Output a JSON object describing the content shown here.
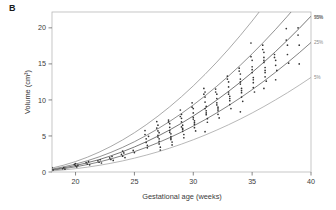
{
  "panel": {
    "label": "B"
  },
  "chart_data": {
    "type": "line",
    "title": "",
    "subtitle": "",
    "xlabel": "Gestational age (weeks)",
    "ylabel": "Volume (cm³)",
    "xlim": [
      18,
      40
    ],
    "ylim": [
      0,
      22.2
    ],
    "xticks": [
      20,
      25,
      30,
      35,
      40
    ],
    "xtick_labels": [
      "20",
      "25",
      "30",
      "35",
      "40"
    ],
    "yticks": [
      0,
      5,
      10,
      15,
      20
    ],
    "ytick_labels": [
      "0",
      "5",
      "10",
      "15",
      "20"
    ],
    "grid": false,
    "legend_position": "right-inline-curve-labels",
    "annotations": [
      "95%",
      "75%",
      "50%",
      "25%",
      "5%"
    ],
    "x": [
      18,
      19,
      20,
      21,
      22,
      23,
      24,
      25,
      26,
      27,
      28,
      29,
      30,
      31,
      32,
      33,
      34,
      35,
      36,
      37,
      38,
      39,
      40
    ],
    "series": [
      {
        "name": "95%",
        "label": "95%",
        "color": "#8c8c8c",
        "values": [
          0.55,
          0.95,
          1.45,
          2.05,
          2.75,
          3.55,
          4.45,
          5.45,
          6.55,
          7.75,
          9.05,
          10.45,
          11.95,
          13.55,
          15.25,
          17.05,
          18.95,
          20.95,
          23.05,
          25.25,
          27.55,
          29.95,
          32.45
        ]
      },
      {
        "name": "75%",
        "label": "75%",
        "color": "#6e6e6e",
        "values": [
          0.4,
          0.72,
          1.1,
          1.56,
          2.1,
          2.72,
          3.42,
          4.2,
          5.06,
          6.0,
          7.02,
          8.12,
          9.3,
          10.56,
          11.9,
          13.32,
          14.82,
          16.4,
          18.06,
          19.8,
          21.62,
          23.52,
          25.5
        ]
      },
      {
        "name": "50%",
        "label": "50%",
        "color": "#4a4a4a",
        "values": [
          0.32,
          0.58,
          0.9,
          1.28,
          1.72,
          2.24,
          2.82,
          3.47,
          4.19,
          4.98,
          5.84,
          6.77,
          7.77,
          8.84,
          9.98,
          11.19,
          12.47,
          13.82,
          15.24,
          16.73,
          18.29,
          19.92,
          21.62
        ]
      },
      {
        "name": "25%",
        "label": "25%",
        "color": "#5a5a5a",
        "values": [
          0.25,
          0.46,
          0.72,
          1.03,
          1.39,
          1.81,
          2.29,
          2.82,
          3.41,
          4.06,
          4.77,
          5.54,
          6.37,
          7.26,
          8.21,
          9.22,
          10.29,
          11.42,
          12.61,
          13.86,
          15.17,
          16.54,
          17.97
        ]
      },
      {
        "name": "5%",
        "label": "5%",
        "color": "#a0a0a0",
        "values": [
          0.15,
          0.29,
          0.46,
          0.67,
          0.92,
          1.21,
          1.54,
          1.92,
          2.34,
          2.8,
          3.31,
          3.87,
          4.47,
          5.12,
          5.82,
          6.56,
          7.35,
          8.19,
          9.08,
          10.02,
          11.0,
          12.04,
          13.12
        ]
      }
    ],
    "scatter": {
      "name": "observations",
      "marker": "dot",
      "color": "#333333",
      "points": [
        [
          18.0,
          0.62
        ],
        [
          18.1,
          0.28
        ],
        [
          18.9,
          0.45
        ],
        [
          19.0,
          0.6
        ],
        [
          19.1,
          0.38
        ],
        [
          19.9,
          1.05
        ],
        [
          20.0,
          0.85
        ],
        [
          20.0,
          1.15
        ],
        [
          20.1,
          0.7
        ],
        [
          20.2,
          0.95
        ],
        [
          20.9,
          1.3
        ],
        [
          21.0,
          1.1
        ],
        [
          21.1,
          1.45
        ],
        [
          21.2,
          1.0
        ],
        [
          21.9,
          1.55
        ],
        [
          22.0,
          1.35
        ],
        [
          22.1,
          1.7
        ],
        [
          22.2,
          1.25
        ],
        [
          22.9,
          1.95
        ],
        [
          23.0,
          1.75
        ],
        [
          23.1,
          2.15
        ],
        [
          23.2,
          1.6
        ],
        [
          23.9,
          2.45
        ],
        [
          24.0,
          2.2
        ],
        [
          24.1,
          2.65
        ],
        [
          24.2,
          2.0
        ],
        [
          24.0,
          2.9
        ],
        [
          24.9,
          3.0
        ],
        [
          25.0,
          2.7
        ],
        [
          25.9,
          5.75
        ],
        [
          26.0,
          4.6
        ],
        [
          26.0,
          4.1
        ],
        [
          26.1,
          3.7
        ],
        [
          26.1,
          3.35
        ],
        [
          26.2,
          4.95
        ],
        [
          25.9,
          5.2
        ],
        [
          26.9,
          7.0
        ],
        [
          27.0,
          6.5
        ],
        [
          27.0,
          5.7
        ],
        [
          27.0,
          5.1
        ],
        [
          27.1,
          4.6
        ],
        [
          27.1,
          4.25
        ],
        [
          27.1,
          3.9
        ],
        [
          27.2,
          3.45
        ],
        [
          27.2,
          3.05
        ],
        [
          26.9,
          6.1
        ],
        [
          27.0,
          4.85
        ],
        [
          27.1,
          5.45
        ],
        [
          27.9,
          7.2
        ],
        [
          28.0,
          6.7
        ],
        [
          28.0,
          6.2
        ],
        [
          28.0,
          5.75
        ],
        [
          28.1,
          5.3
        ],
        [
          28.1,
          4.9
        ],
        [
          28.1,
          4.5
        ],
        [
          28.2,
          4.15
        ],
        [
          28.2,
          3.75
        ],
        [
          27.9,
          6.95
        ],
        [
          28.0,
          5.5
        ],
        [
          28.1,
          4.7
        ],
        [
          28.9,
          8.6
        ],
        [
          29.0,
          8.0
        ],
        [
          29.0,
          7.45
        ],
        [
          29.0,
          6.95
        ],
        [
          29.1,
          6.5
        ],
        [
          29.1,
          6.05
        ],
        [
          29.1,
          5.65
        ],
        [
          29.2,
          5.2
        ],
        [
          29.2,
          4.75
        ],
        [
          28.9,
          7.7
        ],
        [
          29.0,
          6.25
        ],
        [
          29.1,
          5.9
        ],
        [
          29.9,
          9.6
        ],
        [
          30.0,
          8.8
        ],
        [
          30.0,
          8.2
        ],
        [
          30.0,
          7.6
        ],
        [
          30.1,
          7.1
        ],
        [
          30.1,
          6.6
        ],
        [
          30.1,
          6.15
        ],
        [
          30.2,
          5.7
        ],
        [
          29.9,
          9.0
        ],
        [
          30.0,
          7.35
        ],
        [
          30.1,
          6.85
        ],
        [
          30.9,
          11.6
        ],
        [
          31.0,
          11.1
        ],
        [
          31.0,
          10.4
        ],
        [
          31.0,
          9.7
        ],
        [
          31.1,
          9.1
        ],
        [
          31.1,
          8.5
        ],
        [
          31.1,
          7.95
        ],
        [
          31.2,
          7.4
        ],
        [
          31.2,
          6.9
        ],
        [
          30.9,
          10.8
        ],
        [
          31.0,
          8.8
        ],
        [
          31.1,
          8.2
        ],
        [
          31.0,
          5.6
        ],
        [
          31.9,
          11.5
        ],
        [
          32.0,
          10.8
        ],
        [
          32.0,
          10.2
        ],
        [
          32.0,
          9.6
        ],
        [
          32.1,
          9.0
        ],
        [
          32.1,
          8.5
        ],
        [
          32.1,
          8.0
        ],
        [
          32.2,
          7.5
        ],
        [
          31.9,
          11.1
        ],
        [
          32.0,
          9.3
        ],
        [
          32.1,
          8.75
        ],
        [
          32.9,
          13.3
        ],
        [
          33.0,
          12.5
        ],
        [
          33.0,
          11.8
        ],
        [
          33.0,
          11.1
        ],
        [
          33.1,
          10.5
        ],
        [
          33.1,
          9.9
        ],
        [
          33.1,
          9.35
        ],
        [
          33.2,
          8.8
        ],
        [
          32.9,
          12.9
        ],
        [
          33.0,
          10.8
        ],
        [
          33.1,
          10.2
        ],
        [
          33.9,
          14.4
        ],
        [
          34.0,
          13.6
        ],
        [
          34.0,
          12.9
        ],
        [
          34.0,
          12.2
        ],
        [
          34.1,
          11.6
        ],
        [
          34.1,
          11.0
        ],
        [
          34.1,
          10.4
        ],
        [
          34.2,
          9.8
        ],
        [
          33.9,
          14.0
        ],
        [
          34.0,
          12.5
        ],
        [
          34.1,
          11.3
        ],
        [
          34.0,
          8.35
        ],
        [
          34.9,
          17.9
        ],
        [
          35.0,
          15.5
        ],
        [
          35.0,
          14.6
        ],
        [
          35.0,
          13.8
        ],
        [
          35.1,
          13.1
        ],
        [
          35.1,
          12.4
        ],
        [
          35.1,
          11.7
        ],
        [
          35.2,
          11.1
        ],
        [
          34.9,
          16.0
        ],
        [
          35.0,
          14.2
        ],
        [
          35.1,
          12.8
        ],
        [
          35.9,
          17.6
        ],
        [
          36.0,
          16.6
        ],
        [
          36.0,
          15.9
        ],
        [
          36.0,
          15.2
        ],
        [
          36.1,
          14.5
        ],
        [
          36.1,
          13.8
        ],
        [
          36.1,
          13.2
        ],
        [
          36.2,
          12.6
        ],
        [
          35.9,
          17.0
        ],
        [
          36.0,
          15.5
        ],
        [
          36.1,
          14.1
        ],
        [
          36.0,
          11.6
        ],
        [
          36.9,
          16.3
        ],
        [
          37.0,
          15.5
        ],
        [
          37.0,
          14.8
        ],
        [
          37.1,
          14.1
        ],
        [
          36.9,
          15.9
        ],
        [
          37.0,
          12.8
        ],
        [
          37.9,
          19.9
        ],
        [
          38.0,
          17.6
        ],
        [
          38.0,
          16.3
        ],
        [
          38.1,
          15.1
        ],
        [
          37.9,
          18.3
        ],
        [
          38.9,
          20.0
        ],
        [
          39.0,
          17.6
        ],
        [
          39.0,
          15.0
        ],
        [
          38.9,
          19.0
        ]
      ]
    }
  }
}
